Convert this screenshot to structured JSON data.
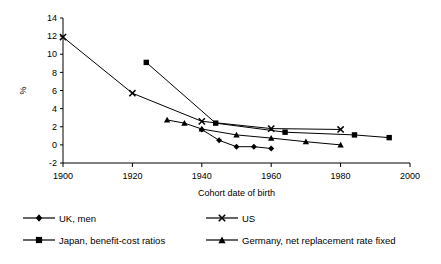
{
  "chart_data": {
    "type": "line",
    "title": "",
    "xlabel": "Cohort date of birth",
    "ylabel": "%",
    "xlim": [
      1900,
      2000
    ],
    "ylim": [
      -2,
      14
    ],
    "xticks": [
      1900,
      1920,
      1940,
      1960,
      1980,
      2000
    ],
    "yticks": [
      -2,
      0,
      2,
      4,
      6,
      8,
      10,
      12,
      14
    ],
    "grid": false,
    "legend_position": "bottom",
    "series": [
      {
        "name": "UK, men",
        "marker": "diamond",
        "x": [
          1940,
          1945,
          1950,
          1955,
          1960
        ],
        "values": [
          1.7,
          0.5,
          -0.2,
          -0.2,
          -0.4
        ]
      },
      {
        "name": "US",
        "marker": "x",
        "x": [
          1900,
          1920,
          1940,
          1960,
          1980
        ],
        "values": [
          11.9,
          5.7,
          2.6,
          1.8,
          1.7
        ]
      },
      {
        "name": "Japan, benefit-cost ratios",
        "marker": "square",
        "x": [
          1924,
          1944,
          1964,
          1984,
          1994
        ],
        "values": [
          9.1,
          2.4,
          1.4,
          1.1,
          0.8
        ]
      },
      {
        "name": "Germany, net replacement rate fixed",
        "marker": "triangle",
        "x": [
          1930,
          1935,
          1940,
          1950,
          1960,
          1970,
          1980
        ],
        "values": [
          2.75,
          2.4,
          1.75,
          1.1,
          0.75,
          0.35,
          0.0
        ]
      }
    ]
  },
  "legend": {
    "items": [
      {
        "label": "UK, men",
        "marker": "diamond"
      },
      {
        "label": "US",
        "marker": "x"
      },
      {
        "label": "Japan, benefit-cost ratios",
        "marker": "square"
      },
      {
        "label": "Germany, net replacement rate fixed",
        "marker": "triangle"
      }
    ]
  }
}
